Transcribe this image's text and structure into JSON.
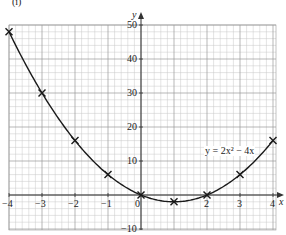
{
  "part_label": "(i)",
  "equation_label": "y = 2x² − 4x",
  "axis": {
    "x_label": "x",
    "y_label": "y"
  },
  "x_ticks": [
    "−4",
    "−3",
    "−2",
    "−1",
    "0",
    "2",
    "3",
    "4"
  ],
  "y_ticks": [
    "50",
    "40",
    "30",
    "20",
    "10",
    "−10"
  ],
  "colors": {
    "grid_minor": "#c8c8c8",
    "grid_major": "#9a9a9a",
    "axis": "#333333",
    "curve": "#1a1a1a",
    "marker": "#1a1a1a"
  },
  "chart_data": {
    "type": "line",
    "title": "y = 2x² − 4x",
    "xlabel": "x",
    "ylabel": "y",
    "x": [
      -4,
      -3,
      -2,
      -1,
      0,
      1,
      2,
      3,
      4
    ],
    "series": [
      {
        "name": "y = 2x² − 4x",
        "values": [
          48,
          30,
          16,
          6,
          0,
          -2,
          0,
          6,
          16
        ],
        "marker": "x",
        "smooth": true
      }
    ],
    "xlim": [
      -4,
      4
    ],
    "ylim": [
      -10,
      50
    ],
    "x_ticks": [
      -4,
      -3,
      -2,
      -1,
      0,
      2,
      3,
      4
    ],
    "y_ticks": [
      -10,
      10,
      20,
      30,
      40,
      50
    ],
    "grid": true,
    "legend": "none"
  }
}
